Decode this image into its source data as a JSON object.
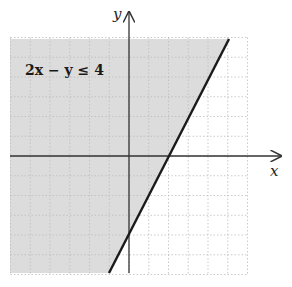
{
  "chart_data": {
    "type": "inequality-region",
    "title": "",
    "inequality": "2x − y ≤ 4",
    "boundary_line": {
      "equation": "y = 2x - 4",
      "style": "solid",
      "points": [
        [
          -1,
          -6
        ],
        [
          5,
          6
        ]
      ]
    },
    "x_intercept": 2,
    "y_intercept": -4,
    "shaded_side": "above-left",
    "xlabel": "x",
    "ylabel": "y",
    "xlim": [
      -6,
      6
    ],
    "ylim": [
      -6,
      6
    ],
    "grid": true,
    "grid_step": 1
  },
  "labels": {
    "inequality_text": "2x − y ≤ 4",
    "x_axis": "x",
    "y_axis": "y"
  },
  "colors": {
    "shade": "#dcdcdc",
    "line": "#1a1a1a",
    "grid": "#bdbdbd",
    "axis": "#333333"
  }
}
